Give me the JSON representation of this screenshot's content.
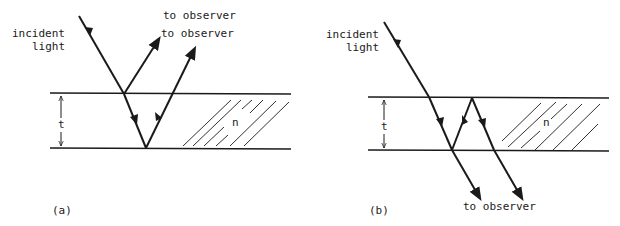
{
  "figure": {
    "panels": [
      {
        "id": "a",
        "caption": "(a)",
        "labels": {
          "incident_line1": "incident",
          "incident_line2": "light",
          "observer_1": "to observer",
          "observer_2": "to observer",
          "thickness": "t",
          "index": "n"
        }
      },
      {
        "id": "b",
        "caption": "(b)",
        "labels": {
          "incident_line1": "incident",
          "incident_line2": "light",
          "observer": "to observer",
          "thickness": "t",
          "index": "n"
        }
      }
    ],
    "colors": {
      "ink": "#1a1a1a",
      "background": "#ffffff"
    }
  }
}
